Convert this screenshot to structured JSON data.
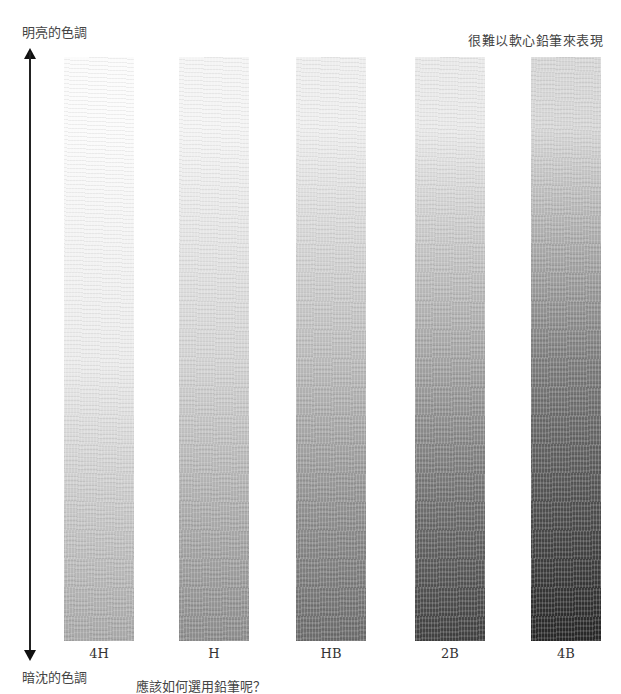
{
  "labels": {
    "top_left": "明亮的色調",
    "top_right": "很難以軟心鉛筆來表現",
    "bottom_left": "暗沈的色調",
    "question": "應該如何選用鉛筆呢？"
  },
  "arrow": {
    "direction": "bidirectional-vertical",
    "color": "#222222"
  },
  "strips": [
    {
      "grade": "4H",
      "x": 64,
      "top_color": "#fbfbfb",
      "mid_color": "#ebebeb",
      "bottom_color": "#a6a6a6"
    },
    {
      "grade": "H",
      "x": 179,
      "top_color": "#f4f4f4",
      "mid_color": "#d2d2d2",
      "bottom_color": "#8a8a8a"
    },
    {
      "grade": "HB",
      "x": 296,
      "top_color": "#eeeeee",
      "mid_color": "#b9b9b9",
      "bottom_color": "#6a6a6a"
    },
    {
      "grade": "2B",
      "x": 415,
      "top_color": "#e9e9e9",
      "mid_color": "#a2a2a2",
      "bottom_color": "#3f3f3f"
    },
    {
      "grade": "4B",
      "x": 531,
      "top_color": "#d6d6d6",
      "mid_color": "#7c7c7c",
      "bottom_color": "#262626"
    }
  ]
}
